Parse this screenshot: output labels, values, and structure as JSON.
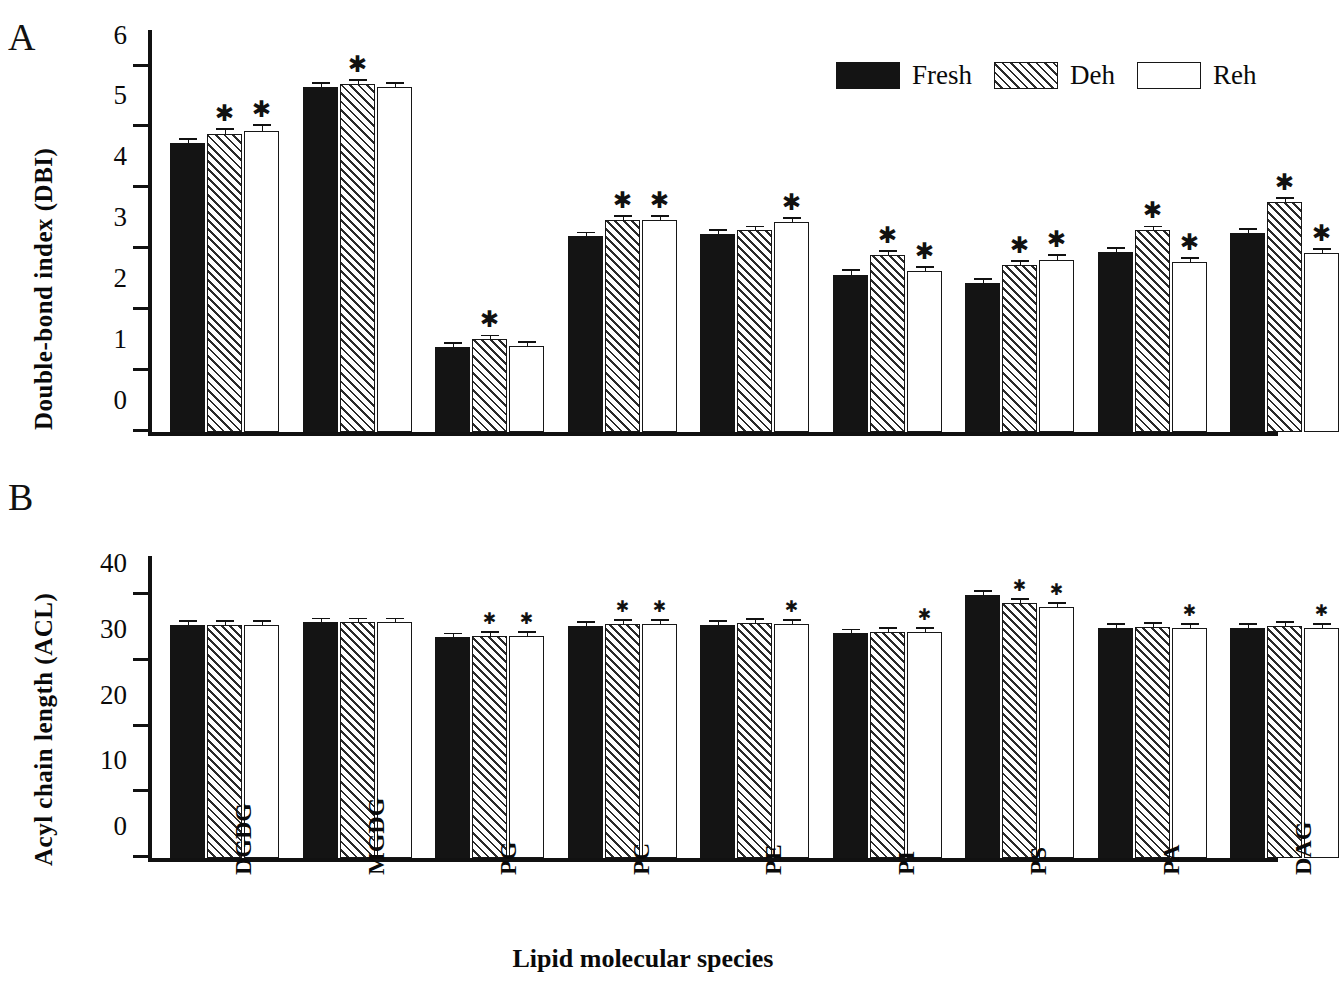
{
  "panels": {
    "a_letter": "A",
    "b_letter": "B"
  },
  "legend": {
    "items": [
      {
        "label": "Fresh",
        "style": "solid-black",
        "icon": "solid-swatch-icon"
      },
      {
        "label": "Deh",
        "style": "diagonal-hatch",
        "icon": "hatched-swatch-icon"
      },
      {
        "label": "Reh",
        "style": "open-white",
        "icon": "open-swatch-icon"
      }
    ]
  },
  "xlabel": "Lipid molecular species",
  "chart_data": [
    {
      "type": "bar",
      "panel": "A",
      "title": "",
      "xlabel": "Lipid molecular species",
      "ylabel": "Double-bond index (DBI)",
      "ylim": [
        0,
        6.6
      ],
      "yticks": [
        0,
        1,
        2,
        3,
        4,
        5,
        6
      ],
      "grid": false,
      "legend_position": "top-right",
      "categories": [
        "DGDG",
        "MGDG",
        "PG",
        "PC",
        "PE",
        "PI",
        "PS",
        "PA",
        "DAG"
      ],
      "series": [
        {
          "name": "Fresh",
          "values": [
            4.75,
            5.66,
            1.4,
            3.21,
            3.25,
            2.57,
            2.44,
            2.96,
            3.27
          ],
          "errors": [
            0.04,
            0.03,
            0.02,
            0.03,
            0.03,
            0.07,
            0.06,
            0.05,
            0.03
          ],
          "significant": [
            false,
            false,
            false,
            false,
            false,
            false,
            false,
            false,
            false
          ]
        },
        {
          "name": "Deh",
          "values": [
            4.9,
            5.72,
            1.52,
            3.48,
            3.31,
            2.91,
            2.74,
            3.31,
            3.77
          ],
          "errors": [
            0.06,
            0.03,
            0.03,
            0.03,
            0.03,
            0.05,
            0.05,
            0.04,
            0.06
          ],
          "significant": [
            true,
            true,
            true,
            true,
            false,
            true,
            true,
            true,
            true
          ]
        },
        {
          "name": "Reh",
          "values": [
            4.95,
            5.66,
            1.41,
            3.48,
            3.45,
            2.64,
            2.82,
            2.79,
            2.94
          ],
          "errors": [
            0.07,
            0.02,
            0.04,
            0.03,
            0.05,
            0.03,
            0.07,
            0.03,
            0.03
          ],
          "significant": [
            true,
            false,
            false,
            true,
            true,
            true,
            true,
            true,
            true
          ]
        }
      ]
    },
    {
      "type": "bar",
      "panel": "B",
      "title": "",
      "xlabel": "Lipid molecular species",
      "ylabel": "Acyl chain length (ACL)",
      "ylim": [
        0,
        46
      ],
      "yticks": [
        0,
        10,
        20,
        30,
        40
      ],
      "grid": false,
      "legend_position": "none",
      "categories": [
        "DGDG",
        "MGDG",
        "PG",
        "PC",
        "PE",
        "PI",
        "PS",
        "PA",
        "DAG"
      ],
      "series": [
        {
          "name": "Fresh",
          "values": [
            35.5,
            35.9,
            33.6,
            35.3,
            35.5,
            34.2,
            40.1,
            35.0,
            35.1
          ],
          "errors": [
            0.1,
            0.1,
            0.1,
            0.1,
            0.1,
            0.1,
            0.15,
            0.1,
            0.1
          ],
          "significant": [
            false,
            false,
            false,
            false,
            false,
            false,
            false,
            false,
            false
          ]
        },
        {
          "name": "Deh",
          "values": [
            35.5,
            35.9,
            33.8,
            35.6,
            35.8,
            34.5,
            38.8,
            35.2,
            35.3
          ],
          "errors": [
            0.1,
            0.1,
            0.1,
            0.1,
            0.1,
            0.1,
            0.15,
            0.1,
            0.1
          ],
          "significant": [
            false,
            false,
            true,
            true,
            false,
            false,
            true,
            false,
            false
          ]
        },
        {
          "name": "Reh",
          "values": [
            35.5,
            35.9,
            33.8,
            35.7,
            35.6,
            34.4,
            38.2,
            35.0,
            35.1
          ],
          "errors": [
            0.1,
            0.1,
            0.1,
            0.1,
            0.1,
            0.1,
            0.3,
            0.1,
            0.1
          ],
          "significant": [
            false,
            false,
            true,
            true,
            true,
            true,
            true,
            true,
            true
          ]
        }
      ]
    }
  ]
}
